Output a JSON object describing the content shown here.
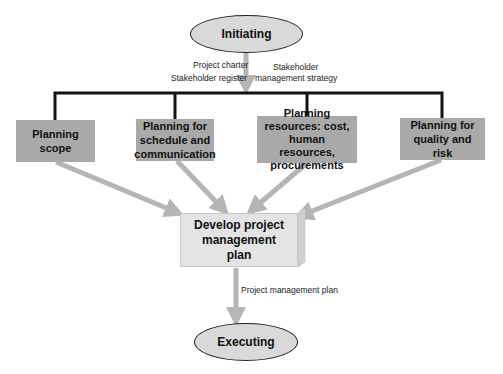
{
  "diagram": {
    "start_node": {
      "label": "Initiating",
      "shape": "ellipse"
    },
    "end_node": {
      "label": "Executing",
      "shape": "ellipse"
    },
    "inputs_from_initiating": {
      "left": [
        "Project charter",
        "Stakeholder register"
      ],
      "right": [
        "Stakeholder",
        "management strategy"
      ]
    },
    "planning_boxes": [
      {
        "id": "scope",
        "label": "Planning scope"
      },
      {
        "id": "schedule",
        "label": "Planning for schedule and communication"
      },
      {
        "id": "resources",
        "label": "Planning resources: cost, human resources, procurements"
      },
      {
        "id": "quality",
        "label": "Planning for quality and risk"
      }
    ],
    "central_node": {
      "label": "Develop project management plan"
    },
    "output_label": "Project management plan",
    "colors": {
      "ellipse_fill": "#d9d9d9",
      "planning_box_fill": "#a9a9a9",
      "develop_box_fill": "#e3e3e3",
      "arrow_gray": "#b5b5b5",
      "connector_black": "#111111"
    }
  }
}
